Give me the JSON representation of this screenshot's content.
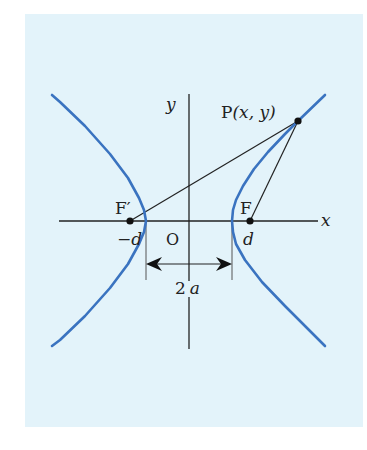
{
  "diagram": {
    "background_color": "#e3f3fa",
    "curve_color": "#3a73c0",
    "line_color": "#222222",
    "axes": {
      "x_label": "x",
      "y_label": "y",
      "origin_label": "O"
    },
    "points": {
      "P": {
        "label": "P",
        "coords_label": "(x, y)"
      },
      "F": {
        "label": "F",
        "coord_label": "d"
      },
      "F_prime": {
        "label": "F′",
        "coord_label": "−d"
      }
    },
    "dimension": {
      "label_num": "2",
      "label_var": "a",
      "description": "distance between vertices"
    }
  }
}
